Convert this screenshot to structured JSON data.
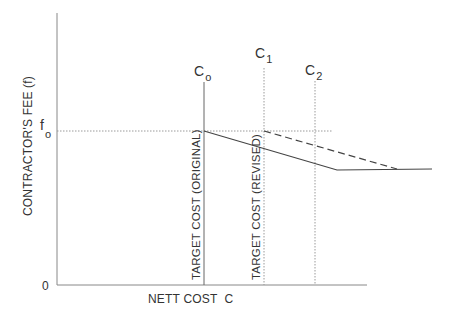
{
  "diagram": {
    "type": "target-cost-fee-graph",
    "colors": {
      "axis": "#888888",
      "line": "#444444",
      "text": "#333333",
      "guide": "#9a9a9a",
      "background": "#ffffff"
    },
    "axes": {
      "y_label": "CONTRACTOR'S FEE (f)",
      "x_label": "NETT COST  C",
      "origin_label": "0"
    },
    "levels": {
      "fee_level": {
        "symbol": "f",
        "subscript": "o"
      }
    },
    "cost_markers": [
      {
        "id": "c0",
        "symbol": "C",
        "subscript": "o",
        "style": "solid",
        "caption": "TARGET COST (ORIGINAL)"
      },
      {
        "id": "c1",
        "symbol": "C",
        "subscript": "1",
        "style": "dotted",
        "caption": "TARGET COST (REVISED)"
      },
      {
        "id": "c2",
        "symbol": "C",
        "subscript": "2",
        "style": "dotted",
        "caption": ""
      }
    ],
    "fee_curves": [
      {
        "id": "original-fee-curve",
        "style": "solid",
        "description": "Fee falls from f_o at C_o, then levels off at a minimum fee"
      },
      {
        "id": "revised-fee-curve",
        "style": "dashed",
        "description": "Fee falls from f_o at C_1, then joins the minimum fee level"
      }
    ]
  }
}
